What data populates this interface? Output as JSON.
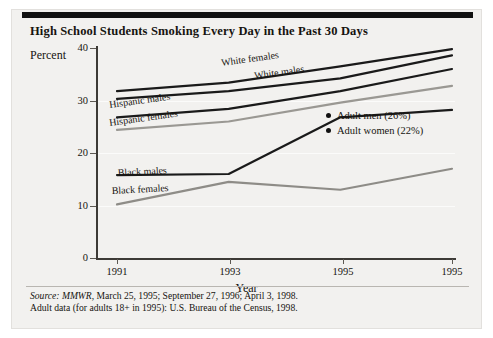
{
  "chart_data": {
    "type": "line",
    "title": "High School Students Smoking Every Day in the Past 30 Days",
    "xlabel": "Year",
    "ylabel": "Percent",
    "x": [
      "1991",
      "1993",
      "1995",
      "1995"
    ],
    "xlim": [
      0,
      3
    ],
    "ylim": [
      0,
      40
    ],
    "yticks": [
      0,
      10,
      20,
      30,
      40
    ],
    "grid": true,
    "legend_position": "inside-right",
    "series": [
      {
        "name": "White females",
        "color": "#1a1a1a",
        "values": [
          31.8,
          33.4,
          36.5,
          39.8
        ]
      },
      {
        "name": "White males",
        "color": "#1a1a1a",
        "values": [
          30.3,
          31.8,
          34.2,
          38.6
        ]
      },
      {
        "name": "Hispanic males",
        "color": "#1a1a1a",
        "values": [
          26.8,
          28.4,
          31.8,
          36.0
        ]
      },
      {
        "name": "Hispanic females",
        "color": "#9a9893",
        "values": [
          24.4,
          26.0,
          29.6,
          32.8
        ]
      },
      {
        "name": "Black males",
        "color": "#1a1a1a",
        "values": [
          15.8,
          16.0,
          26.8,
          28.2
        ]
      },
      {
        "name": "Black females",
        "color": "#8e8c87",
        "values": [
          10.2,
          14.5,
          13.0,
          17.0
        ]
      }
    ],
    "annotations": [
      {
        "label": "Adult men (26%)",
        "marker": "dot"
      },
      {
        "label": "Adult women (22%)",
        "marker": "dot"
      }
    ]
  },
  "title": "High School Students Smoking Every Day in the Past 30 Days",
  "axes": {
    "ylabel": "Percent",
    "xlabel": "Year",
    "yticks": [
      "40",
      "30",
      "20",
      "10",
      "0"
    ],
    "xticks": [
      "1991",
      "1993",
      "1995",
      "1995"
    ]
  },
  "series_labels": {
    "white_females": "White females",
    "white_males": "White males",
    "hispanic_males": "Hispanic males",
    "hispanic_females": "Hispanic females",
    "black_males": "Black males",
    "black_females": "Black females"
  },
  "legend": {
    "adult_men": "Adult men (26%)",
    "adult_women": "Adult women (22%)"
  },
  "footnotes": {
    "source_prefix": "Source:",
    "source_journal": "MMWR",
    "source_rest": ", March 25, 1995; September 27, 1996; April 3, 1998.",
    "line2": "Adult data (for adults 18+ in 1995): U.S. Bureau of the Census, 1998."
  }
}
